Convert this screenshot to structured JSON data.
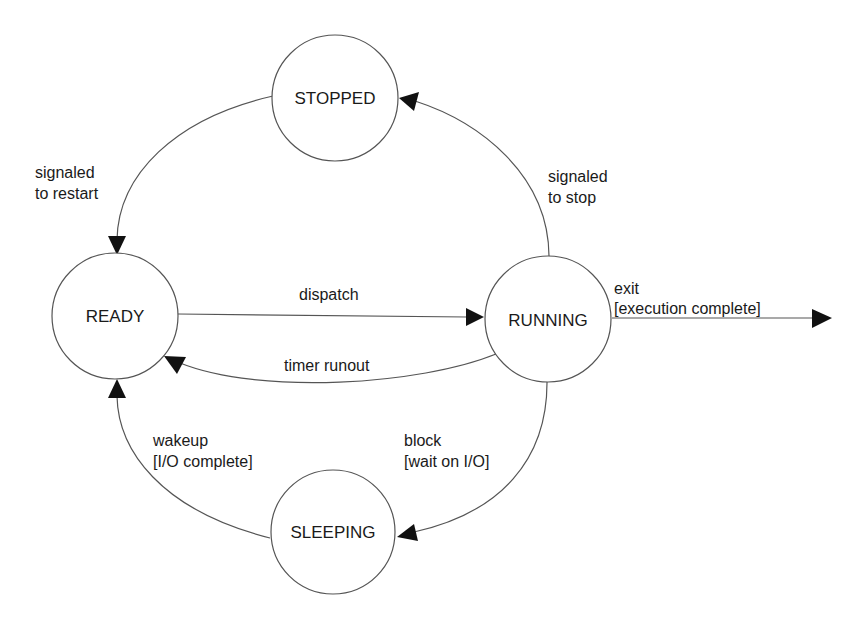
{
  "diagram": {
    "type": "state-machine",
    "title": "",
    "colors": {
      "stroke": "#555555",
      "arrowhead": "#111111",
      "text": "#1a1a1a",
      "background": "#ffffff"
    },
    "states": [
      {
        "id": "stopped",
        "label": "STOPPED"
      },
      {
        "id": "ready",
        "label": "READY"
      },
      {
        "id": "running",
        "label": "RUNNING"
      },
      {
        "id": "sleeping",
        "label": "SLEEPING"
      }
    ],
    "transitions": [
      {
        "id": "restart",
        "from": "stopped",
        "to": "ready",
        "label_lines": [
          "signaled",
          "to restart"
        ]
      },
      {
        "id": "stop",
        "from": "running",
        "to": "stopped",
        "label_lines": [
          "signaled",
          "to stop"
        ]
      },
      {
        "id": "dispatch",
        "from": "ready",
        "to": "running",
        "label_lines": [
          "dispatch"
        ]
      },
      {
        "id": "timer",
        "from": "running",
        "to": "ready",
        "label_lines": [
          "timer runout"
        ]
      },
      {
        "id": "exit",
        "from": "running",
        "to": "final",
        "label_lines": [
          "exit",
          "[execution complete]"
        ]
      },
      {
        "id": "block",
        "from": "running",
        "to": "sleeping",
        "label_lines": [
          "block",
          "[wait on I/O]"
        ]
      },
      {
        "id": "wakeup",
        "from": "sleeping",
        "to": "ready",
        "label_lines": [
          "wakeup",
          "[I/O complete]"
        ]
      }
    ]
  }
}
